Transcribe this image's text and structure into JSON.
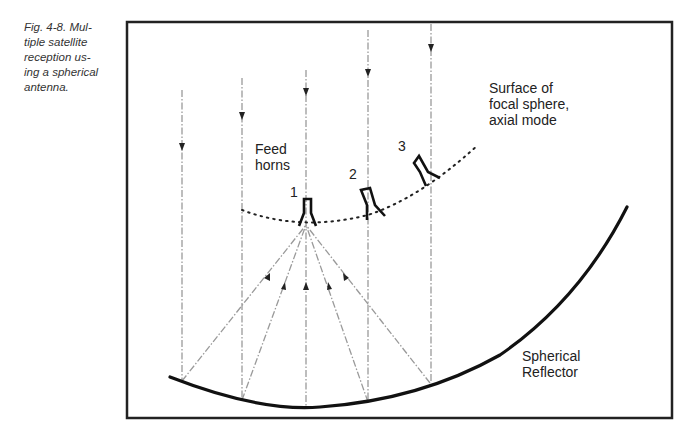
{
  "caption": {
    "lines": [
      "Fig. 4-8. Mul-",
      "tiple satellite",
      "reception us-",
      "ing a spherical",
      "antenna."
    ],
    "full_text": "Fig. 4-8. Multiple satellite reception using a spherical antenna."
  },
  "diagram": {
    "labels": {
      "feed_horns_line1": "Feed",
      "feed_horns_line2": "horns",
      "focal_surface_line1": "Surface of",
      "focal_surface_line2": "focal sphere,",
      "focal_surface_line3": "axial mode",
      "reflector_line1": "Spherical",
      "reflector_line2": "Reflector"
    },
    "horns": [
      {
        "id": "1",
        "label": "1"
      },
      {
        "id": "2",
        "label": "2"
      },
      {
        "id": "3",
        "label": "3"
      }
    ],
    "colors": {
      "frame": "#222222",
      "reflector": "#111111",
      "rays": "#9a9a9a",
      "text": "#222222"
    }
  }
}
